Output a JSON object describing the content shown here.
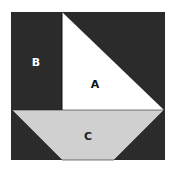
{
  "diagram": {
    "labels": {
      "a": "A",
      "b": "B",
      "c": "C"
    },
    "colors": {
      "dark": "#2b2b2b",
      "white": "#ffffff",
      "gray": "#d0d0d0",
      "stroke": "#111111"
    }
  }
}
